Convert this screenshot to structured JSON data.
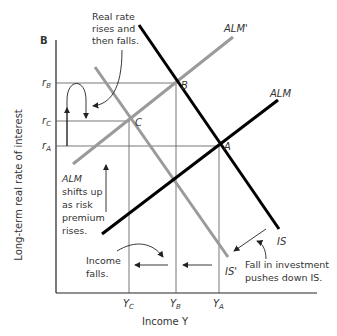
{
  "panel_label": "B",
  "axes": {
    "ylabel": "Long-term real rate of interest",
    "xlabel": "Income Y",
    "y_ticks": [
      {
        "label": "r",
        "sub": "B",
        "y": 83
      },
      {
        "label": "r",
        "sub": "C",
        "y": 121
      },
      {
        "label": "r",
        "sub": "A",
        "y": 146
      }
    ],
    "x_ticks": [
      {
        "label": "Y",
        "sub": "C",
        "x": 129
      },
      {
        "label": "Y",
        "sub": "B",
        "x": 176
      },
      {
        "label": "Y",
        "sub": "A",
        "x": 219
      }
    ]
  },
  "curves": {
    "alm": {
      "label": "ALM",
      "color": "#000000"
    },
    "alm_prime": {
      "label": "ALM'",
      "color": "#999999"
    },
    "is": {
      "label": "IS",
      "color": "#000000"
    },
    "is_prime": {
      "label": "IS'",
      "color": "#999999"
    }
  },
  "points": {
    "a": "A",
    "b": "B",
    "c": "C"
  },
  "annotations": {
    "real_rate": [
      "Real rate",
      "rises and",
      "then falls."
    ],
    "alm_shift": [
      "ALM",
      "shifts up",
      "as risk",
      "premium",
      "rises."
    ],
    "income_falls": [
      "Income",
      "falls."
    ],
    "investment": [
      "Fall in investment",
      "pushes down IS."
    ]
  }
}
